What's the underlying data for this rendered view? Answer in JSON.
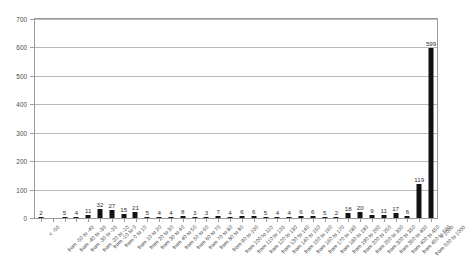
{
  "chart_data": {
    "type": "bar",
    "title": "",
    "subtitle": "",
    "xlabel": "",
    "ylabel": "",
    "ylim": [
      0,
      700
    ],
    "ytick_values": [
      0,
      100,
      200,
      300,
      400,
      500,
      600,
      700
    ],
    "ytick_labels": [
      "0",
      "100",
      "200",
      "300",
      "400",
      "500",
      "600",
      "700"
    ],
    "grid": "horizontal",
    "legend": "none",
    "bar_color": "#121212",
    "grid_color": "#b9b9b9",
    "frame_color": "#9a9a9a",
    "show_value_labels": true,
    "categories": [
      "< -50",
      "from -50 to -40",
      "from -40 to -30",
      "from -30 to -20",
      "from -20 to -10",
      "from -10 to 0",
      "from 0 to 10",
      "from 10 to 20",
      "from 20 to 30",
      "from 30 to 40",
      "from 40 to 50",
      "from 50 to 60",
      "from 60 to 70",
      "from 70 to 80",
      "from 80 to 90",
      "from 90 to 100",
      "from 100 to 110",
      "from 110 to 120",
      "from 120 to 130",
      "from 130 to 140",
      "from 140 to 150",
      "from 150 to 160",
      "from 160 to 170",
      "from 170 to 180",
      "from 180 to 190",
      "from 190 to 200",
      "from 200 to 250",
      "from 250 to 300",
      "from 300 to 350",
      "from 350 to 400",
      "from 400 to 450",
      "from 450 to 500",
      "from 500 to 1000",
      "> 1000"
    ],
    "values": [
      2,
      0,
      5,
      4,
      11,
      32,
      27,
      15,
      21,
      5,
      4,
      4,
      8,
      3,
      3,
      7,
      4,
      6,
      6,
      5,
      4,
      4,
      6,
      6,
      5,
      2,
      18,
      20,
      9,
      11,
      17,
      6,
      119,
      599
    ],
    "value_labels": [
      "2",
      "",
      "5",
      "4",
      "11",
      "32",
      "27",
      "15",
      "21",
      "5",
      "4",
      "4",
      "8",
      "3",
      "3",
      "7",
      "4",
      "6",
      "6",
      "5",
      "4",
      "4",
      "6",
      "6",
      "5",
      "2",
      "18",
      "20",
      "9",
      "11",
      "17",
      "6",
      "119",
      "599"
    ]
  }
}
